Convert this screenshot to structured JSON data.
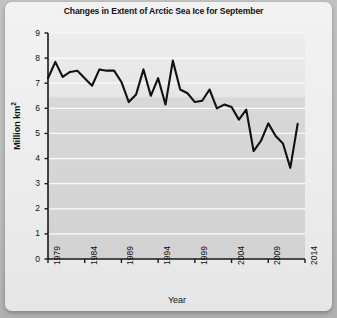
{
  "chart_data": {
    "type": "line",
    "title": "Changes in Extent of Arctic Sea Ice for September",
    "xlabel": "Year",
    "ylabel": "Million km",
    "ylabel_sup": "2",
    "ylabel_full": "Million km2",
    "xlim": [
      1979,
      2014
    ],
    "ylim": [
      0,
      9
    ],
    "ytick_labels": [
      "9",
      "8",
      "7",
      "6",
      "5",
      "4",
      "3",
      "2",
      "1",
      "0"
    ],
    "ytick_values": [
      9,
      8,
      7,
      6,
      5,
      4,
      3,
      2,
      1,
      0
    ],
    "xtick_labels": [
      "1979",
      "1984",
      "1989",
      "1994",
      "1999",
      "2004",
      "2009",
      "2014"
    ],
    "xtick_values": [
      1979,
      1984,
      1989,
      1994,
      1999,
      2004,
      2009,
      2014
    ],
    "grid": "horizontal",
    "legend": "none",
    "series_name": "September Arctic sea ice extent",
    "line_color": "#111111",
    "plot_bg_top_color": "#e8e8e8",
    "plot_bg_main_color": "#d6d6d6",
    "x": [
      1979,
      1980,
      1981,
      1982,
      1983,
      1984,
      1985,
      1986,
      1987,
      1988,
      1989,
      1990,
      1991,
      1992,
      1993,
      1994,
      1995,
      1996,
      1997,
      1998,
      1999,
      2000,
      2001,
      2002,
      2003,
      2004,
      2005,
      2006,
      2007,
      2008,
      2009,
      2010,
      2011,
      2012,
      2013
    ],
    "values": [
      7.2,
      7.85,
      7.25,
      7.45,
      7.5,
      7.2,
      6.9,
      7.55,
      7.5,
      7.5,
      7.05,
      6.25,
      6.55,
      7.55,
      6.5,
      7.2,
      6.15,
      7.9,
      6.75,
      6.6,
      6.25,
      6.3,
      6.75,
      6.0,
      6.15,
      6.05,
      5.55,
      5.95,
      4.3,
      4.7,
      5.4,
      4.9,
      4.6,
      3.63,
      5.38
    ],
    "annotations": [
      {
        "label": "maximum",
        "year": 1996,
        "value": 7.9
      },
      {
        "label": "minimum",
        "year": 2012,
        "value": 3.63
      }
    ]
  }
}
